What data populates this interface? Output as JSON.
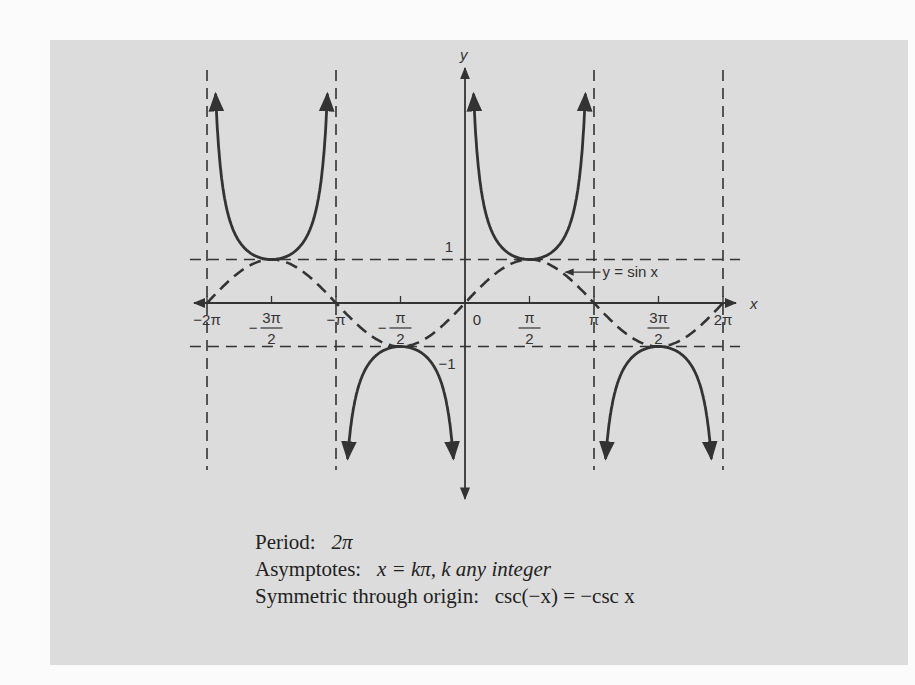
{
  "chart_data": {
    "type": "line",
    "title": "",
    "xlabel": "x",
    "ylabel": "y",
    "xlim": [
      -6.6,
      6.6
    ],
    "ylim": [
      -4.5,
      5.4
    ],
    "grid": false,
    "x_ticks": [
      {
        "value": -6.2832,
        "label": "−2π"
      },
      {
        "value": -4.7124,
        "label": "−3π/2"
      },
      {
        "value": -3.1416,
        "label": "−π"
      },
      {
        "value": -1.5708,
        "label": "−π/2"
      },
      {
        "value": 0,
        "label": "0"
      },
      {
        "value": 1.5708,
        "label": "π/2"
      },
      {
        "value": 3.1416,
        "label": "π"
      },
      {
        "value": 4.7124,
        "label": "3π/2"
      },
      {
        "value": 6.2832,
        "label": "2π"
      }
    ],
    "y_ticks": [
      {
        "value": 1,
        "label": "1"
      },
      {
        "value": -1,
        "label": "−1"
      }
    ],
    "series": [
      {
        "name": "y = csc x",
        "style": "solid",
        "function": "1/sin(x)",
        "domain": [
          -6.2832,
          6.2832
        ]
      },
      {
        "name": "y = sin x",
        "style": "dashed",
        "function": "sin(x)",
        "domain": [
          -6.2832,
          6.2832
        ]
      }
    ],
    "reference_lines": {
      "vertical_asymptotes": [
        -6.2832,
        -3.1416,
        3.1416,
        6.2832
      ],
      "horizontal": [
        1,
        -1
      ]
    },
    "annotations": [
      {
        "text": "y = sin x",
        "points_to": "sin curve near x≈2.3"
      }
    ]
  },
  "axes": {
    "x_label": "x",
    "y_label": "y",
    "y_one": "1",
    "y_neg_one": "−1"
  },
  "annotation": {
    "sin_label": "y = sin x"
  },
  "caption": {
    "period_label": "Period:",
    "period_value": "2π",
    "asymptotes_label": "Asymptotes:",
    "asymptotes_value": "x = kπ, k any integer",
    "symmetry_label": "Symmetric through origin:",
    "symmetry_value": "csc(−x) = −csc x"
  },
  "colors": {
    "panel": "#dcdcdc",
    "ink": "#333333",
    "page": "#fbfbfb"
  }
}
